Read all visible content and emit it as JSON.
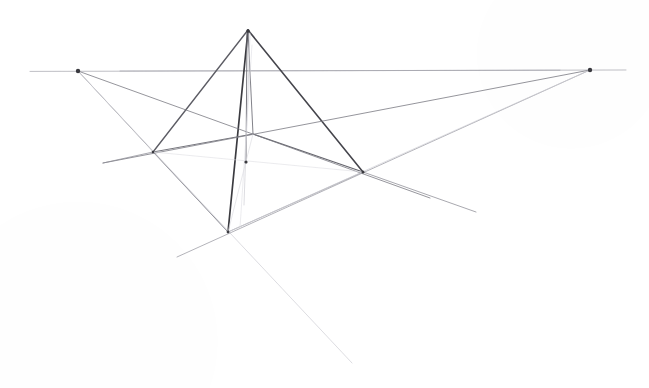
{
  "artwork": {
    "title": "Two-point perspective construction of a pyramid",
    "medium": "graphite pencil on white paper",
    "canvas": {
      "width": 649,
      "height": 388,
      "background": "#ffffff"
    },
    "ink_colors": {
      "strong_pencil": "#3b3b40",
      "medium_pencil": "#6d6d74",
      "light_pencil": "#9d9da4",
      "faint_pencil": "#c3c3c9",
      "very_faint_pencil": "#d8d8dd"
    },
    "key_points": {
      "apex": {
        "label": "apex",
        "x": 248,
        "y": 30
      },
      "vanishing_point_left": {
        "label": "left vanishing point",
        "x": 78,
        "y": 71
      },
      "vanishing_point_right": {
        "label": "right vanishing point",
        "x": 590,
        "y": 70
      },
      "base_left": {
        "label": "left base corner",
        "x": 153,
        "y": 152
      },
      "base_right": {
        "label": "right base corner",
        "x": 363,
        "y": 172
      },
      "base_front": {
        "label": "front base corner",
        "x": 228,
        "y": 232
      },
      "base_back": {
        "label": "back base corner",
        "x": 253,
        "y": 134
      },
      "axis_foot": {
        "label": "central axis foot mark",
        "x": 246,
        "y": 163
      }
    },
    "horizon": {
      "label": "horizon line",
      "y": 70.6,
      "x_start": 30,
      "x_end": 626
    },
    "strokes": [
      {
        "name": "horizon-line",
        "kind": "horizon",
        "x1": 30,
        "y1": 71.4,
        "x2": 626,
        "y2": 70.0,
        "color": "#b3b3ba",
        "width": 0.9,
        "opacity": 0.95
      },
      {
        "name": "horizon-line-overdraw",
        "kind": "horizon",
        "x1": 120,
        "y1": 71.0,
        "x2": 560,
        "y2": 70.2,
        "color": "#a0a0a8",
        "width": 0.8,
        "opacity": 0.8
      },
      {
        "name": "pyramid-edge-apex-to-left-base",
        "kind": "solid-edge",
        "x1": 248,
        "y1": 30,
        "x2": 153,
        "y2": 152,
        "color": "#5c5c64",
        "width": 1.35,
        "opacity": 1
      },
      {
        "name": "pyramid-edge-apex-to-right-base",
        "kind": "solid-edge",
        "x1": 248,
        "y1": 30,
        "x2": 363,
        "y2": 172,
        "color": "#45454c",
        "width": 1.6,
        "opacity": 1
      },
      {
        "name": "pyramid-edge-apex-to-front-base",
        "kind": "solid-edge",
        "x1": 248,
        "y1": 30,
        "x2": 228,
        "y2": 232,
        "color": "#3b3b40",
        "width": 1.7,
        "opacity": 1
      },
      {
        "name": "pyramid-edge-apex-to-back-base",
        "kind": "hidden-edge",
        "x1": 248,
        "y1": 30,
        "x2": 253,
        "y2": 134,
        "color": "#7b7b83",
        "width": 1.0,
        "opacity": 0.95
      },
      {
        "name": "pyramid-central-axis",
        "kind": "axis",
        "x1": 247,
        "y1": 33,
        "x2": 246,
        "y2": 163,
        "color": "#6a6a72",
        "width": 1.0,
        "opacity": 0.9
      },
      {
        "name": "pyramid-central-axis-ghost",
        "kind": "axis",
        "x1": 250,
        "y1": 33,
        "x2": 244,
        "y2": 205,
        "color": "#cdcdd3",
        "width": 0.8,
        "opacity": 0.85
      },
      {
        "name": "base-edge-left-to-back",
        "kind": "base-edge",
        "x1": 153,
        "y1": 152,
        "x2": 253,
        "y2": 134,
        "color": "#6f6f77",
        "width": 1.0,
        "opacity": 0.95
      },
      {
        "name": "base-edge-back-to-right",
        "kind": "base-edge",
        "x1": 253,
        "y1": 134,
        "x2": 363,
        "y2": 172,
        "color": "#5e5e66",
        "width": 1.1,
        "opacity": 0.95
      },
      {
        "name": "base-edge-left-to-front",
        "kind": "base-edge",
        "x1": 153,
        "y1": 152,
        "x2": 228,
        "y2": 232,
        "color": "#a6a6ad",
        "width": 0.9,
        "opacity": 0.9
      },
      {
        "name": "base-edge-front-to-right",
        "kind": "base-edge",
        "x1": 228,
        "y1": 232,
        "x2": 363,
        "y2": 172,
        "color": "#9a9aa2",
        "width": 0.9,
        "opacity": 0.9
      },
      {
        "name": "construction-left-vp-to-left-base-extended",
        "kind": "construction",
        "x1": 78,
        "y1": 71,
        "x2": 228,
        "y2": 232,
        "color": "#8b8b93",
        "width": 0.85,
        "opacity": 0.9
      },
      {
        "name": "construction-left-vp-to-back-base-extended",
        "kind": "construction",
        "x1": 78,
        "y1": 71,
        "x2": 430,
        "y2": 198,
        "color": "#7d7d85",
        "width": 0.9,
        "opacity": 0.9
      },
      {
        "name": "construction-left-vp-long-descent",
        "kind": "construction",
        "x1": 78,
        "y1": 71,
        "x2": 352,
        "y2": 363,
        "color": "#d2d2d8",
        "width": 0.85,
        "opacity": 0.9
      },
      {
        "name": "construction-right-vp-to-back-base-extended",
        "kind": "construction",
        "x1": 590,
        "y1": 70,
        "x2": 103,
        "y2": 163,
        "color": "#7f7f87",
        "width": 0.9,
        "opacity": 0.92
      },
      {
        "name": "construction-right-vp-to-right-base-extended",
        "kind": "construction",
        "x1": 590,
        "y1": 70,
        "x2": 177,
        "y2": 257,
        "color": "#9c9ca4",
        "width": 0.85,
        "opacity": 0.9
      },
      {
        "name": "construction-right-vp-faint-descent",
        "kind": "construction",
        "x1": 590,
        "y1": 70,
        "x2": 228,
        "y2": 232,
        "color": "#cfcfd5",
        "width": 0.8,
        "opacity": 0.85
      },
      {
        "name": "construction-ground-line-right-extension",
        "kind": "construction",
        "x1": 363,
        "y1": 172,
        "x2": 476,
        "y2": 212,
        "color": "#8e8e96",
        "width": 0.85,
        "opacity": 0.9
      },
      {
        "name": "construction-ground-line-left-extension",
        "kind": "construction",
        "x1": 153,
        "y1": 152,
        "x2": 103,
        "y2": 163,
        "color": "#8e8e96",
        "width": 0.85,
        "opacity": 0.9
      },
      {
        "name": "construction-diagonal-front-to-back-left",
        "kind": "construction",
        "x1": 228,
        "y1": 232,
        "x2": 253,
        "y2": 134,
        "color": "#dadae0",
        "width": 0.8,
        "opacity": 0.8
      },
      {
        "name": "construction-diagonal-left-to-right-base",
        "kind": "construction",
        "x1": 153,
        "y1": 152,
        "x2": 363,
        "y2": 172,
        "color": "#dcdce1",
        "width": 0.75,
        "opacity": 0.75
      },
      {
        "name": "construction-apex-drop-overshoot",
        "kind": "construction",
        "x1": 252,
        "y1": 45,
        "x2": 240,
        "y2": 228,
        "color": "#dddde2",
        "width": 0.7,
        "opacity": 0.8
      }
    ],
    "vertex_marks": [
      {
        "name": "vertex-mark-left-vp",
        "x": 78,
        "y": 71,
        "r": 2.2
      },
      {
        "name": "vertex-mark-right-vp",
        "x": 590,
        "y": 70,
        "r": 2.2
      },
      {
        "name": "vertex-mark-apex",
        "x": 248,
        "y": 31,
        "r": 1.8
      },
      {
        "name": "vertex-mark-axis-foot",
        "x": 246,
        "y": 162,
        "r": 1.6
      },
      {
        "name": "vertex-mark-right-base",
        "x": 363,
        "y": 172,
        "r": 1.5
      },
      {
        "name": "vertex-mark-front-base",
        "x": 228,
        "y": 232,
        "r": 1.4
      },
      {
        "name": "vertex-mark-left-base",
        "x": 153,
        "y": 152,
        "r": 1.3
      }
    ]
  }
}
